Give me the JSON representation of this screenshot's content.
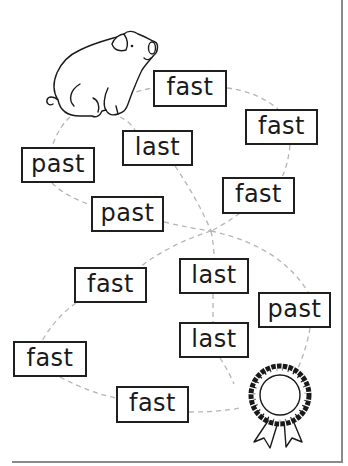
{
  "worksheet": {
    "start_picture": "pig",
    "end_picture": "award-ribbon",
    "path_style": "dashed",
    "colors": {
      "box_border": "#1f1f1f",
      "text": "#1a1a1a",
      "path": "#b5b5b5",
      "frame": "#8a8a8a"
    },
    "words": [
      {
        "id": "w1",
        "text": "fast",
        "x": 153,
        "y": 70,
        "w": 74,
        "h": 37
      },
      {
        "id": "w2",
        "text": "fast",
        "x": 245,
        "y": 109,
        "w": 73,
        "h": 36
      },
      {
        "id": "w3",
        "text": "last",
        "x": 122,
        "y": 130,
        "w": 71,
        "h": 36
      },
      {
        "id": "w4",
        "text": "past",
        "x": 21,
        "y": 147,
        "w": 74,
        "h": 36
      },
      {
        "id": "w5",
        "text": "fast",
        "x": 222,
        "y": 177,
        "w": 73,
        "h": 37
      },
      {
        "id": "w6",
        "text": "past",
        "x": 91,
        "y": 196,
        "w": 73,
        "h": 36
      },
      {
        "id": "w7",
        "text": "last",
        "x": 179,
        "y": 258,
        "w": 70,
        "h": 36
      },
      {
        "id": "w8",
        "text": "fast",
        "x": 74,
        "y": 267,
        "w": 73,
        "h": 36
      },
      {
        "id": "w9",
        "text": "past",
        "x": 258,
        "y": 292,
        "w": 73,
        "h": 36
      },
      {
        "id": "w10",
        "text": "last",
        "x": 179,
        "y": 322,
        "w": 70,
        "h": 36
      },
      {
        "id": "w11",
        "text": "fast",
        "x": 13,
        "y": 341,
        "w": 74,
        "h": 36
      },
      {
        "id": "w12",
        "text": "fast",
        "x": 116,
        "y": 386,
        "w": 73,
        "h": 37
      }
    ]
  }
}
